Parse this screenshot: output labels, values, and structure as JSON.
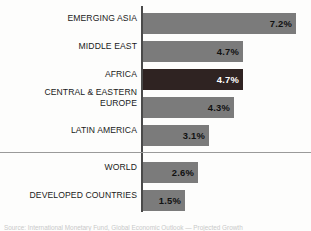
{
  "chart_data": {
    "type": "bar",
    "orientation": "horizontal",
    "title": "",
    "subtitle": "",
    "xlabel": "",
    "ylabel": "",
    "grid": false,
    "legend": null,
    "axis_baseline": 0,
    "value_suffix": "%",
    "xlim": [
      0,
      7.2
    ],
    "categories": [
      "EMERGING ASIA",
      "MIDDLE EAST",
      "AFRICA",
      "CENTRAL & EASTERN\nEUROPE",
      "LATIN AMERICA",
      "WORLD",
      "DEVELOPED COUNTRIES"
    ],
    "values": [
      7.2,
      4.7,
      4.7,
      4.3,
      3.1,
      2.6,
      1.5
    ],
    "value_labels": [
      "7.2%",
      "4.7%",
      "4.7%",
      "4.3%",
      "3.1%",
      "2.6%",
      "1.5%"
    ],
    "highlight_index": 2,
    "group_separator_after_index": 4,
    "colors": {
      "bar": "#7b7b7b",
      "bar_highlight": "#2f2322",
      "axis": "#4a4a4a",
      "separator": "#9a9a9a",
      "label_text": "#1a1a1a",
      "value_text": "#111111",
      "value_text_highlight": "#ffffff",
      "background": "#fdfdfc"
    }
  },
  "bars": [
    {
      "label": "EMERGING ASIA",
      "value_label": "7.2%",
      "top": 13,
      "width": 153,
      "highlight": false,
      "two_line": false
    },
    {
      "label": "MIDDLE EAST",
      "value_label": "4.7%",
      "top": 41,
      "width": 100,
      "highlight": false,
      "two_line": false
    },
    {
      "label": "AFRICA",
      "value_label": "4.7%",
      "top": 69,
      "width": 100,
      "highlight": true,
      "two_line": false
    },
    {
      "label": "CENTRAL & EASTERN\nEUROPE",
      "value_label": "4.3%",
      "top": 97,
      "width": 91,
      "highlight": false,
      "two_line": true
    },
    {
      "label": "LATIN AMERICA",
      "value_label": "3.1%",
      "top": 125,
      "width": 66,
      "highlight": false,
      "two_line": false
    },
    {
      "label": "WORLD",
      "value_label": "2.6%",
      "top": 162,
      "width": 55,
      "highlight": false,
      "two_line": false
    },
    {
      "label": "DEVELOPED COUNTRIES",
      "value_label": "1.5%",
      "top": 190,
      "width": 42,
      "highlight": false,
      "two_line": false
    }
  ],
  "footer": {
    "source_note": "Source: International Monetary Fund, Global Economic Outlook — Projected Growth"
  }
}
